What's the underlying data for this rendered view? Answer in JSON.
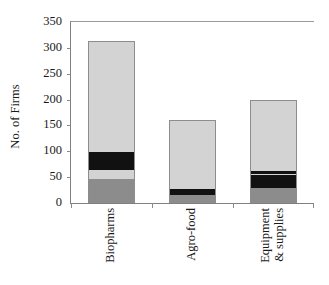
{
  "chart_data": {
    "type": "bar",
    "subtype": "stacked-vertical",
    "title": "",
    "xlabel": "",
    "ylabel": "No. of Firms",
    "ylim": [
      0,
      350
    ],
    "yticks": [
      0,
      50,
      100,
      150,
      200,
      250,
      300,
      350
    ],
    "ytick_labels": [
      "0",
      "50",
      "100",
      "150",
      "200",
      "250",
      "300",
      "350"
    ],
    "grid": false,
    "legend": "none",
    "categories": [
      "Biopharms",
      "Agro-food",
      "Equipment & supplies"
    ],
    "category_label_lines": [
      [
        "Biopharms"
      ],
      [
        "Agro-food"
      ],
      [
        "Equipment",
        "& supplies"
      ]
    ],
    "totals": [
      313,
      160,
      200
    ],
    "series": [
      {
        "name": "segment-1",
        "color": "#8c8c8c",
        "values": [
          46,
          13,
          27
        ]
      },
      {
        "name": "segment-2",
        "color": "#d3d3d3",
        "values": [
          17,
          12,
          26
        ]
      },
      {
        "name": "segment-3",
        "color": "#111111",
        "values": [
          35,
          21,
          3
        ]
      },
      {
        "name": "segment-4",
        "color": "#d3d3d3",
        "values": [
          215,
          114,
          5
        ]
      },
      {
        "name": "segment-5",
        "color": "#111111",
        "values": [
          0,
          0,
          139
        ]
      }
    ],
    "stacks": [
      {
        "category": "Biopharms",
        "total": 313,
        "segments": [
          {
            "value": 46,
            "from": 0,
            "to": 46,
            "color": "#8c8c8c"
          },
          {
            "value": 17,
            "from": 46,
            "to": 63,
            "color": "#d3d3d3"
          },
          {
            "value": 35,
            "from": 63,
            "to": 98,
            "color": "#111111"
          },
          {
            "value": 215,
            "from": 98,
            "to": 313,
            "color": "#d3d3d3"
          }
        ]
      },
      {
        "category": "Agro-food",
        "total": 160,
        "segments": [
          {
            "value": 13,
            "from": 0,
            "to": 13,
            "color": "#8c8c8c"
          },
          {
            "value": 12,
            "from": 13,
            "to": 25,
            "color": "#111111"
          },
          {
            "value": 21,
            "from": 25,
            "to": 46,
            "color": "#d3d3d3"
          },
          {
            "value": 114,
            "from": 46,
            "to": 160,
            "color": "#d3d3d3"
          }
        ]
      },
      {
        "category": "Equipment & supplies",
        "total": 200,
        "segments": [
          {
            "value": 27,
            "from": 0,
            "to": 27,
            "color": "#8c8c8c"
          },
          {
            "value": 26,
            "from": 27,
            "to": 53,
            "color": "#111111"
          },
          {
            "value": 3,
            "from": 53,
            "to": 56,
            "color": "#d3d3d3"
          },
          {
            "value": 5,
            "from": 56,
            "to": 61,
            "color": "#111111"
          },
          {
            "value": 139,
            "from": 61,
            "to": 200,
            "color": "#d3d3d3"
          }
        ]
      }
    ],
    "colors": {
      "dark_gray": "#8c8c8c",
      "light_gray": "#d3d3d3",
      "black": "#111111",
      "axis": "#808080",
      "text": "#1a1a1a",
      "background": "#ffffff"
    }
  }
}
